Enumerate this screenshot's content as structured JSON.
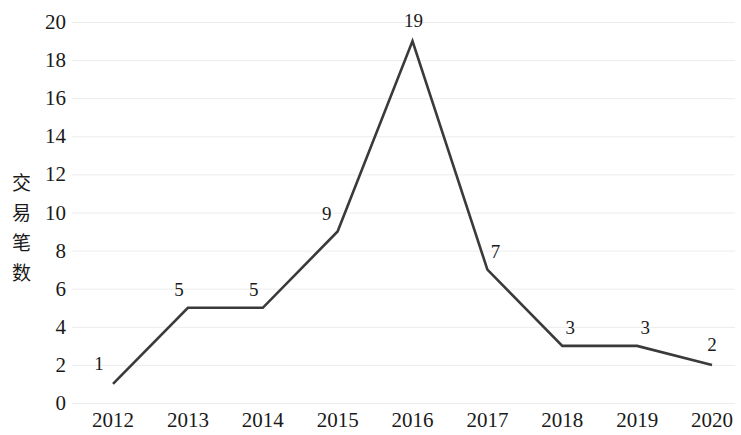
{
  "chart_data": {
    "type": "line",
    "title": "",
    "xlabel": "",
    "ylabel": "交易笔数",
    "categories": [
      "2012",
      "2013",
      "2014",
      "2015",
      "2016",
      "2017",
      "2018",
      "2019",
      "2020"
    ],
    "values": [
      1,
      5,
      5,
      9,
      19,
      7,
      3,
      3,
      2
    ],
    "value_labels": [
      "1",
      "5",
      "5",
      "9",
      "19",
      "7",
      "3",
      "3",
      "2"
    ],
    "ylim": [
      0,
      20
    ],
    "ytick_step": 2,
    "ytick_labels": [
      "20",
      "18",
      "16",
      "14",
      "12",
      "10",
      "8",
      "6",
      "4",
      "2",
      "0"
    ],
    "ytick_values": [
      20,
      18,
      16,
      14,
      12,
      10,
      8,
      6,
      4,
      2,
      0
    ],
    "grid": "horizontal",
    "legend": "none",
    "series": [
      {
        "name": "交易笔数",
        "values": [
          1,
          5,
          5,
          9,
          19,
          7,
          3,
          3,
          2
        ],
        "color": "#3a3a3a",
        "marker": "none",
        "line_width": 2.6
      }
    ],
    "colors": {
      "line": "#3a3a3a",
      "gridline": "#ececec",
      "text": "#1a1a1a",
      "background": "#ffffff"
    },
    "ylabel_chars": [
      "交",
      "易",
      "笔",
      "数"
    ]
  }
}
